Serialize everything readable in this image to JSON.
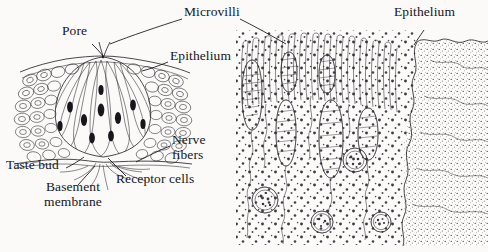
{
  "figure": {
    "width": 488,
    "height": 252,
    "background_color": "#fbfaf9",
    "ink_color": "#1d1b1f",
    "style": "black and white pen-and-ink biological line drawing"
  },
  "panels": {
    "left": {
      "name": "taste-bud-overview",
      "description": "Onion-shaped taste bud embedded in stratified epithelium, opening at a taste pore, with receptor cells bearing dark nuclei and nerve fibers branching beneath the basement membrane."
    },
    "right": {
      "name": "microvilli-detail",
      "description": "Magnified view of microvilli projecting from receptor cells, with stippled epithelium at right and wavy nerve fibers with synaptic bulbs below."
    }
  },
  "labels": [
    {
      "id": "pore",
      "text": "Pore",
      "lines": [
        "Pore"
      ],
      "x": 62,
      "y": 30,
      "panel": "left",
      "leader": true
    },
    {
      "id": "microvilli",
      "text": "Microvilli",
      "lines": [
        "Microvilli"
      ],
      "x": 184,
      "y": 11,
      "panel": "both",
      "leader": true
    },
    {
      "id": "epithelium-left",
      "text": "Epithelium",
      "lines": [
        "Epithelium"
      ],
      "x": 170,
      "y": 55,
      "panel": "left",
      "leader": true
    },
    {
      "id": "epithelium-right",
      "text": "Epithelium",
      "lines": [
        "Epithelium"
      ],
      "x": 394,
      "y": 11,
      "panel": "right",
      "leader": true
    },
    {
      "id": "nerve-fibers",
      "text": "Nerve fibers",
      "lines": [
        "Nerve",
        "fibers"
      ],
      "x": 172,
      "y": 139,
      "panel": "left",
      "leader": true
    },
    {
      "id": "taste-bud",
      "text": "Taste bud",
      "lines": [
        "Taste bud"
      ],
      "x": 6,
      "y": 164,
      "panel": "left",
      "leader": true
    },
    {
      "id": "receptor-cells",
      "text": "Receptor cells",
      "lines": [
        "Receptor cells"
      ],
      "x": 116,
      "y": 178,
      "panel": "left",
      "leader": true
    },
    {
      "id": "basement-membrane",
      "text": "Basement membrane",
      "lines": [
        "Basement",
        "membrane"
      ],
      "x": 36,
      "y": 186,
      "panel": "left",
      "leader": true
    }
  ]
}
